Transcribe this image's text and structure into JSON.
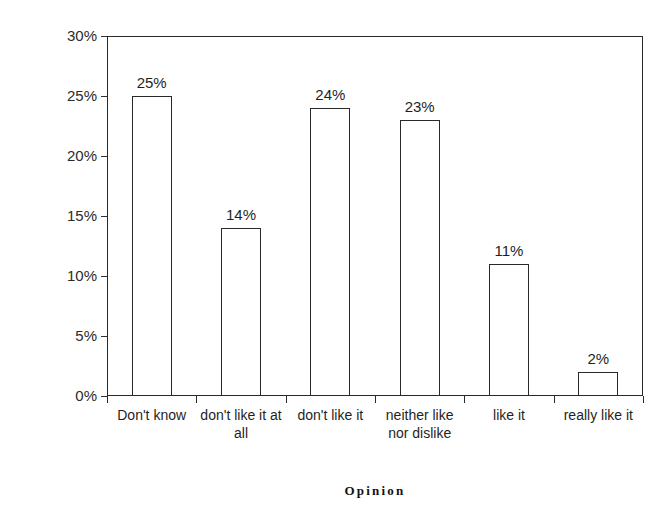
{
  "chart_data": {
    "type": "bar",
    "title": "",
    "title_clipped_remnant": "",
    "xlabel": "Opinion",
    "ylabel": "Percentage of respondents",
    "categories": [
      "Don't know",
      "don't like it at all",
      "don't like it",
      "neither like nor dislike",
      "like it",
      "really like it"
    ],
    "values": [
      25,
      14,
      24,
      23,
      11,
      2
    ],
    "value_labels": [
      "25%",
      "14%",
      "24%",
      "23%",
      "11%",
      "2%"
    ],
    "ylim": [
      0,
      30
    ],
    "ytick_values": [
      0,
      5,
      10,
      15,
      20,
      25,
      30
    ],
    "ytick_labels": [
      "0%",
      "5%",
      "10%",
      "15%",
      "20%",
      "25%",
      "30%"
    ],
    "grid": false,
    "legend": false,
    "bar_fill_color": "#ffffff",
    "bar_edge_color": "#2a2a2a",
    "axis_color": "#2a2a2a",
    "background_color": "#ffffff"
  }
}
